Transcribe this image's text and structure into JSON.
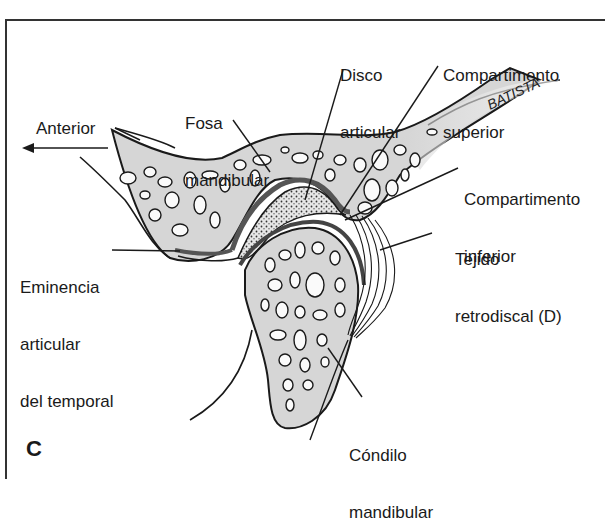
{
  "figure": {
    "panel_letter": "C",
    "signature": "BATISTA",
    "direction": {
      "label": "Anterior",
      "arrow": "left-arrow"
    },
    "labels": {
      "fosa": [
        "Fosa",
        "mandibular"
      ],
      "disco": [
        "Disco",
        "articular"
      ],
      "comp_sup": [
        "Compartimento",
        "superior"
      ],
      "comp_inf": [
        "Compartimento",
        "inferior"
      ],
      "tejido": [
        "Tejido",
        "retrodiscal (D)"
      ],
      "eminencia": [
        "Eminencia",
        "articular",
        "del temporal"
      ],
      "condilo": [
        "Cóndilo",
        "mandibular"
      ]
    },
    "colors": {
      "bone_fill": "#d9d9d9",
      "disc_fill": "#c8c8c8",
      "cartilage": "#555555",
      "line": "#1a1a1a"
    }
  }
}
